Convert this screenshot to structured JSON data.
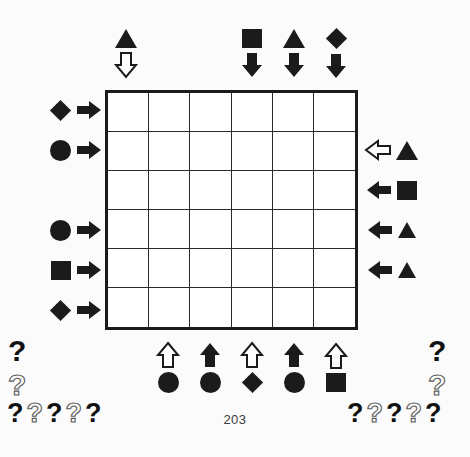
{
  "page": {
    "page_number": "203",
    "background_color": "#fbfbfb",
    "ink_color": "#1b1b1b",
    "hollow_outline_color": "#5a5a5a"
  },
  "grid": {
    "columns": 6,
    "rows": 6,
    "border_color": "#1b1b1b",
    "cell_fill": "#ffffff"
  },
  "clues": {
    "top": [
      {
        "column": 1,
        "shape": "triangle",
        "arrow": "down-arrow-hollow",
        "arrow_style": "hollow"
      },
      {
        "column": 2,
        "shape": null,
        "arrow": null,
        "arrow_style": null
      },
      {
        "column": 3,
        "shape": null,
        "arrow": null,
        "arrow_style": null
      },
      {
        "column": 4,
        "shape": "square",
        "arrow": "down-arrow-solid",
        "arrow_style": "solid"
      },
      {
        "column": 5,
        "shape": "triangle",
        "arrow": "down-arrow-solid",
        "arrow_style": "solid"
      },
      {
        "column": 6,
        "shape": "diamond",
        "arrow": "down-arrow-solid",
        "arrow_style": "solid"
      }
    ],
    "left": [
      {
        "row": 1,
        "shape": "diamond",
        "arrow": "right-arrow-solid",
        "arrow_style": "solid"
      },
      {
        "row": 2,
        "shape": "circle",
        "arrow": "right-arrow-solid",
        "arrow_style": "solid"
      },
      {
        "row": 3,
        "shape": null,
        "arrow": null,
        "arrow_style": null
      },
      {
        "row": 4,
        "shape": "circle",
        "arrow": "right-arrow-solid",
        "arrow_style": "solid"
      },
      {
        "row": 5,
        "shape": "square",
        "arrow": "right-arrow-solid",
        "arrow_style": "solid"
      },
      {
        "row": 6,
        "shape": "diamond",
        "arrow": "right-arrow-solid",
        "arrow_style": "solid"
      }
    ],
    "right": [
      {
        "row": 1,
        "arrow": null,
        "arrow_style": null,
        "shape": null
      },
      {
        "row": 2,
        "arrow": "left-arrow-hollow",
        "arrow_style": "hollow",
        "shape": "triangle"
      },
      {
        "row": 3,
        "arrow": "left-arrow-solid",
        "arrow_style": "solid",
        "shape": "square"
      },
      {
        "row": 4,
        "arrow": "left-arrow-solid",
        "arrow_style": "solid",
        "shape": "triangle"
      },
      {
        "row": 5,
        "arrow": "left-arrow-solid",
        "arrow_style": "solid",
        "shape": "triangle"
      },
      {
        "row": 6,
        "arrow": null,
        "arrow_style": null,
        "shape": null
      }
    ],
    "bottom": [
      {
        "column": 1,
        "arrow": null,
        "arrow_style": null,
        "shape": null
      },
      {
        "column": 2,
        "arrow": "up-arrow-hollow",
        "arrow_style": "hollow",
        "shape": "circle"
      },
      {
        "column": 3,
        "arrow": "up-arrow-solid",
        "arrow_style": "solid",
        "shape": "circle"
      },
      {
        "column": 4,
        "arrow": "up-arrow-hollow",
        "arrow_style": "hollow",
        "shape": "diamond"
      },
      {
        "column": 5,
        "arrow": "up-arrow-solid",
        "arrow_style": "solid",
        "shape": "circle"
      },
      {
        "column": 6,
        "arrow": "up-arrow-hollow",
        "arrow_style": "hollow",
        "shape": "square"
      }
    ]
  },
  "question_marks": {
    "glyph": "?",
    "left_stack": [
      {
        "style": "solid"
      },
      {
        "style": "hollow"
      }
    ],
    "left_row": [
      {
        "style": "solid"
      },
      {
        "style": "hollow"
      },
      {
        "style": "solid"
      },
      {
        "style": "hollow"
      },
      {
        "style": "solid"
      }
    ],
    "right_stack": [
      {
        "style": "solid"
      },
      {
        "style": "hollow"
      }
    ],
    "right_row": [
      {
        "style": "solid"
      },
      {
        "style": "hollow"
      },
      {
        "style": "solid"
      },
      {
        "style": "hollow"
      },
      {
        "style": "solid"
      }
    ]
  }
}
